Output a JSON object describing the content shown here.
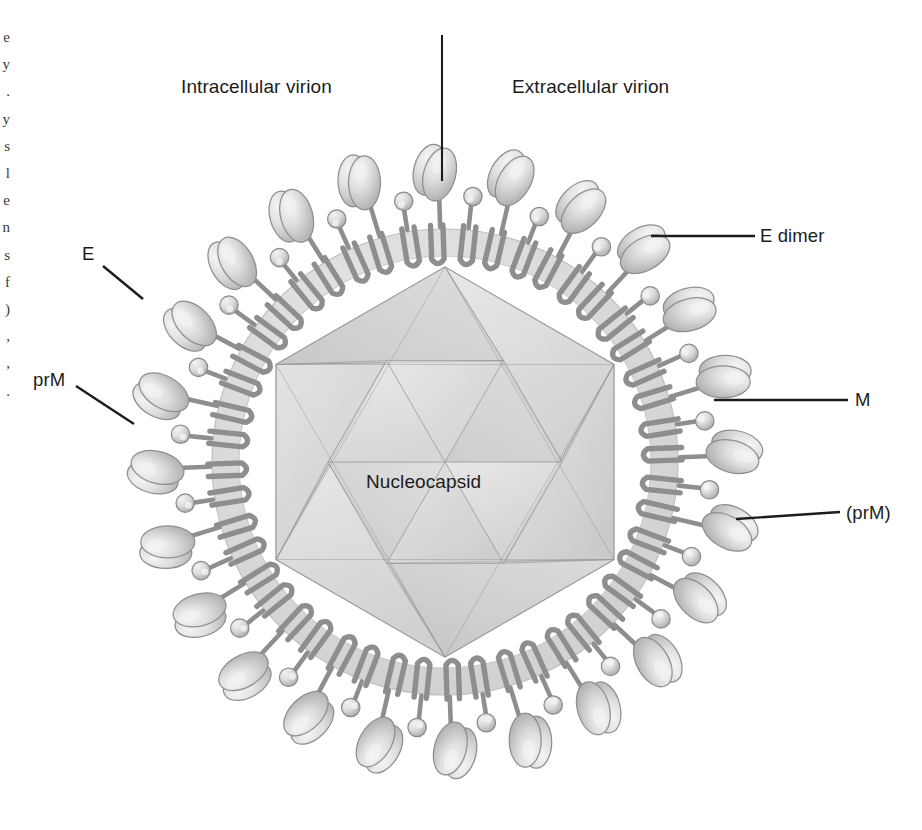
{
  "figure": {
    "background_color": "#ffffff",
    "center": {
      "x": 445,
      "y": 462
    }
  },
  "headers": {
    "left": "Intracellular virion",
    "right": "Extracellular virion",
    "divider": {
      "x": 442,
      "y_top": 35,
      "y_bottom": 181
    }
  },
  "core": {
    "label": "Nucleocapsid",
    "shape": "icosahedron",
    "fill": "#d8d8d8",
    "edge_color": "#9a9a9a",
    "radius": 195
  },
  "membrane": {
    "name": "lipid bilayer",
    "inner_radius": 206,
    "outer_radius": 233,
    "fill": "#dedede",
    "edge_color": "#c2c2c2"
  },
  "proteins": {
    "e": {
      "name": "E",
      "fill": "#e2e2e2",
      "stroke": "#8f8f8f"
    },
    "m": {
      "name": "M",
      "fill": "#dcdcdc",
      "stroke": "#8a8a8a"
    },
    "anchor": {
      "name": "transmembrane hairpin",
      "stroke": "#8e8e8e"
    }
  },
  "callouts": [
    {
      "id": "e-left",
      "text": "E",
      "side": "left",
      "text_pos": {
        "x": 82,
        "y": 243
      },
      "line": {
        "x1": 103,
        "y1": 266,
        "x2": 143,
        "y2": 299
      }
    },
    {
      "id": "prm-left",
      "text": "prM",
      "side": "left",
      "text_pos": {
        "x": 33,
        "y": 369
      },
      "line": {
        "x1": 76,
        "y1": 386,
        "x2": 134,
        "y2": 424
      }
    },
    {
      "id": "e-dimer",
      "text": "E dimer",
      "side": "right",
      "text_pos": {
        "x": 760,
        "y": 225
      },
      "line": {
        "x1": 651,
        "y1": 236,
        "x2": 755,
        "y2": 236
      }
    },
    {
      "id": "m-right",
      "text": "M",
      "side": "right",
      "text_pos": {
        "x": 855,
        "y": 389
      },
      "line": {
        "x1": 714,
        "y1": 400,
        "x2": 848,
        "y2": 400
      }
    },
    {
      "id": "prm-right",
      "text": "(prM)",
      "side": "right",
      "text_pos": {
        "x": 846,
        "y": 502
      },
      "line": {
        "x1": 736,
        "y1": 519,
        "x2": 840,
        "y2": 512
      }
    }
  ],
  "margin_fragments": [
    "e",
    "y",
    ".",
    "y",
    "s",
    "l",
    "e",
    "n",
    "s",
    "f",
    ")",
    ",",
    ",",
    "."
  ],
  "spikes": [
    {
      "angle": 268,
      "type": "E",
      "len": 58
    },
    {
      "angle": 276,
      "type": "M",
      "len": 34
    },
    {
      "angle": 283,
      "type": "E",
      "len": 60
    },
    {
      "angle": 291,
      "type": "M",
      "len": 30
    },
    {
      "angle": 298,
      "type": "E",
      "len": 57
    },
    {
      "angle": 306,
      "type": "M",
      "len": 33
    },
    {
      "angle": 313,
      "type": "E",
      "len": 59
    },
    {
      "angle": 321,
      "type": "M",
      "len": 31
    },
    {
      "angle": 328,
      "type": "E",
      "len": 56
    },
    {
      "angle": 336,
      "type": "M",
      "len": 34
    },
    {
      "angle": 343,
      "type": "E",
      "len": 60
    },
    {
      "angle": 351,
      "type": "M",
      "len": 30
    },
    {
      "angle": 358,
      "type": "E",
      "len": 58
    },
    {
      "angle": 6,
      "type": "M",
      "len": 33
    },
    {
      "angle": 13,
      "type": "E",
      "len": 61
    },
    {
      "angle": 21,
      "type": "M",
      "len": 31
    },
    {
      "angle": 28,
      "type": "E",
      "len": 57
    },
    {
      "angle": 36,
      "type": "M",
      "len": 34
    },
    {
      "angle": 43,
      "type": "E",
      "len": 59
    },
    {
      "angle": 51,
      "type": "M",
      "len": 30
    },
    {
      "angle": 58,
      "type": "E",
      "len": 58
    },
    {
      "angle": 66,
      "type": "M",
      "len": 33
    },
    {
      "angle": 73,
      "type": "E",
      "len": 60
    },
    {
      "angle": 81,
      "type": "M",
      "len": 31
    },
    {
      "angle": 88,
      "type": "E",
      "len": 57
    },
    {
      "angle": 96,
      "type": "M",
      "len": 34
    },
    {
      "angle": 103,
      "type": "E",
      "len": 59
    },
    {
      "angle": 111,
      "type": "M",
      "len": 30
    },
    {
      "angle": 118,
      "type": "E",
      "len": 58
    },
    {
      "angle": 126,
      "type": "M",
      "len": 33
    },
    {
      "angle": 133,
      "type": "E",
      "len": 61
    },
    {
      "angle": 141,
      "type": "M",
      "len": 31
    },
    {
      "angle": 148,
      "type": "E",
      "len": 57
    },
    {
      "angle": 156,
      "type": "M",
      "len": 34
    },
    {
      "angle": 163,
      "type": "E",
      "len": 59
    },
    {
      "angle": 171,
      "type": "M",
      "len": 30
    },
    {
      "angle": 178,
      "type": "E",
      "len": 58
    },
    {
      "angle": 186,
      "type": "M",
      "len": 33
    },
    {
      "angle": 193,
      "type": "E",
      "len": 60
    },
    {
      "angle": 201,
      "type": "M",
      "len": 31
    },
    {
      "angle": 208,
      "type": "E",
      "len": 57
    },
    {
      "angle": 216,
      "type": "M",
      "len": 34
    },
    {
      "angle": 223,
      "type": "E",
      "len": 59
    },
    {
      "angle": 231,
      "type": "M",
      "len": 30
    },
    {
      "angle": 238,
      "type": "E",
      "len": 58
    },
    {
      "angle": 246,
      "type": "M",
      "len": 33
    },
    {
      "angle": 253,
      "type": "E",
      "len": 61
    },
    {
      "angle": 261,
      "type": "M",
      "len": 31
    }
  ]
}
